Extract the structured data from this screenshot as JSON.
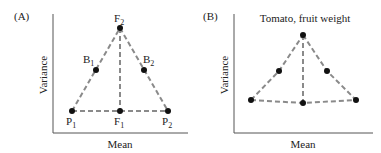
{
  "panels": [
    {
      "id": "A",
      "tag": "(A)",
      "title": "",
      "xlabel": "Mean",
      "ylabel": "Variance",
      "points": [
        {
          "name": "P1",
          "base": "P",
          "sub": "1",
          "x": 72,
          "y": 111,
          "label_pos": "below"
        },
        {
          "name": "F1",
          "base": "F",
          "sub": "1",
          "x": 120,
          "y": 111,
          "label_pos": "below"
        },
        {
          "name": "P2",
          "base": "P",
          "sub": "2",
          "x": 168,
          "y": 111,
          "label_pos": "below"
        },
        {
          "name": "F2",
          "base": "F",
          "sub": "2",
          "x": 120,
          "y": 28,
          "label_pos": "above"
        },
        {
          "name": "B1",
          "base": "B",
          "sub": "1",
          "x": 96,
          "y": 70,
          "label_pos": "left"
        },
        {
          "name": "B2",
          "base": "B",
          "sub": "2",
          "x": 144,
          "y": 70,
          "label_pos": "right"
        }
      ]
    },
    {
      "id": "B",
      "tag": "(B)",
      "title": "Tomato, fruit weight",
      "xlabel": "Mean",
      "ylabel": "Variance",
      "points": [
        {
          "name": "P1",
          "x": 251,
          "y": 100
        },
        {
          "name": "F1",
          "x": 303,
          "y": 103
        },
        {
          "name": "P2",
          "x": 356,
          "y": 100
        },
        {
          "name": "F2",
          "x": 303,
          "y": 35
        },
        {
          "name": "B1",
          "x": 279,
          "y": 71
        },
        {
          "name": "B2",
          "x": 327,
          "y": 71
        }
      ]
    }
  ],
  "colors": {
    "dashed_line": "#8a8a8a",
    "point": "#111111",
    "axis": "#555555",
    "text": "#222222"
  }
}
